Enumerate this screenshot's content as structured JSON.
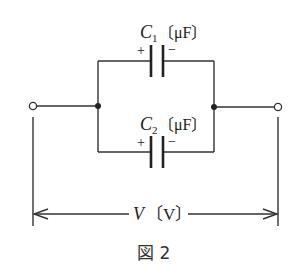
{
  "diagram": {
    "type": "circuit",
    "colors": {
      "wire": "#333333",
      "background": "#ffffff",
      "text": "#222222"
    },
    "components": [
      {
        "id": "C1",
        "symbol": "C",
        "subscript": "1",
        "unit": "〔μF〕",
        "polarity_plus": "+",
        "polarity_minus": "−",
        "branch": "top"
      },
      {
        "id": "C2",
        "symbol": "C",
        "subscript": "2",
        "unit": "〔μF〕",
        "polarity_plus": "+",
        "polarity_minus": "−",
        "branch": "bottom"
      }
    ],
    "terminals": [
      "left-terminal",
      "right-terminal"
    ],
    "junctions": [
      "left-junction",
      "right-junction"
    ],
    "voltage": {
      "symbol": "V",
      "unit": "〔V〕"
    },
    "caption": "図 2"
  }
}
